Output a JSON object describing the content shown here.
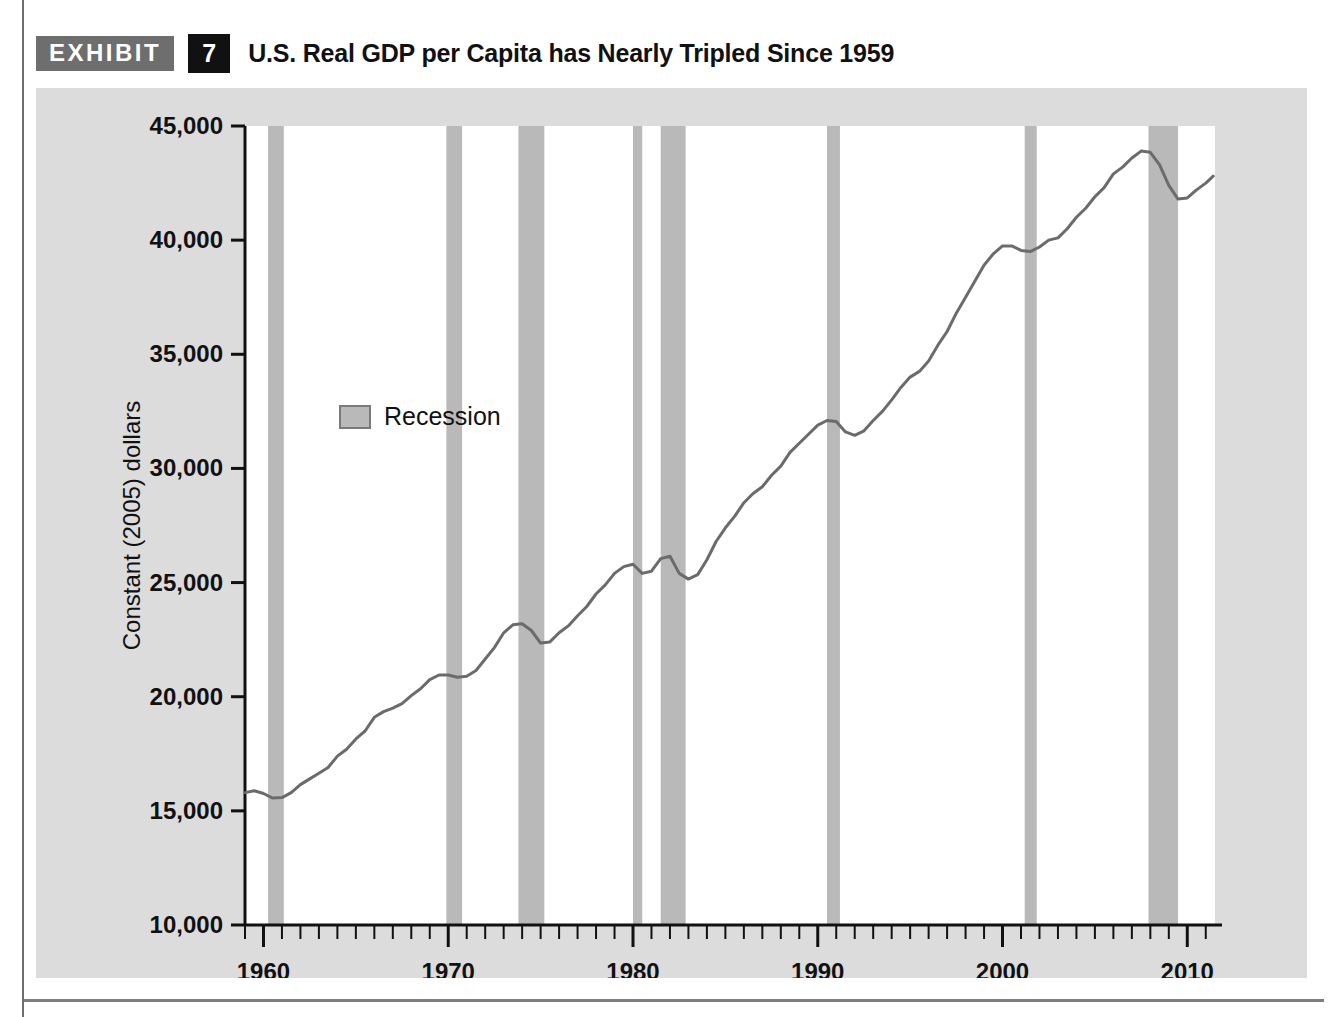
{
  "exhibit": {
    "badge_label": "EXHIBIT",
    "number": "7",
    "title": "U.S. Real GDP per Capita has Nearly Tripled Since 1959"
  },
  "colors": {
    "panel_background": "#dcdcdc",
    "plot_background": "#ffffff",
    "recession_band": "#b9b9b9",
    "line": "#6b6b6b",
    "axis": "#111111",
    "badge_gray": "#6e6e6e",
    "badge_black": "#111111"
  },
  "chart_data": {
    "type": "line",
    "title": "U.S. Real GDP per Capita has Nearly Tripled Since 1959",
    "xlabel": "",
    "ylabel": "Constant (2005) dollars",
    "xlim": [
      1959,
      2011.5
    ],
    "ylim": [
      10000,
      45000
    ],
    "ytick_values": [
      10000,
      15000,
      20000,
      25000,
      30000,
      35000,
      40000,
      45000
    ],
    "ytick_labels": [
      "10,000",
      "15,000",
      "20,000",
      "25,000",
      "30,000",
      "35,000",
      "40,000",
      "45,000"
    ],
    "xtick_values": [
      1960,
      1970,
      1980,
      1990,
      2000,
      2010
    ],
    "xtick_labels": [
      "1960",
      "1970",
      "1980",
      "1990",
      "2000",
      "2010"
    ],
    "minor_xtick_interval": 1,
    "grid": false,
    "legend_position": "inside-upper-left",
    "legend": [
      {
        "label": "Recession",
        "swatch_color": "#b9b9b9",
        "type": "band"
      }
    ],
    "series": [
      {
        "name": "Real GDP per capita",
        "units": "Constant (2005) dollars",
        "x": [
          1959.0,
          1959.5,
          1960.0,
          1960.5,
          1961.0,
          1961.5,
          1962.0,
          1962.5,
          1963.0,
          1963.5,
          1964.0,
          1964.5,
          1965.0,
          1965.5,
          1966.0,
          1966.5,
          1967.0,
          1967.5,
          1968.0,
          1968.5,
          1969.0,
          1969.5,
          1970.0,
          1970.5,
          1971.0,
          1971.5,
          1972.0,
          1972.5,
          1973.0,
          1973.5,
          1974.0,
          1974.5,
          1975.0,
          1975.5,
          1976.0,
          1976.5,
          1977.0,
          1977.5,
          1978.0,
          1978.5,
          1979.0,
          1979.5,
          1980.0,
          1980.5,
          1981.0,
          1981.5,
          1982.0,
          1982.5,
          1983.0,
          1983.5,
          1984.0,
          1984.5,
          1985.0,
          1985.5,
          1986.0,
          1986.5,
          1987.0,
          1987.5,
          1988.0,
          1988.5,
          1989.0,
          1989.5,
          1990.0,
          1990.5,
          1991.0,
          1991.5,
          1992.0,
          1992.5,
          1993.0,
          1993.5,
          1994.0,
          1994.5,
          1995.0,
          1995.5,
          1996.0,
          1996.5,
          1997.0,
          1997.5,
          1998.0,
          1998.5,
          1999.0,
          1999.5,
          2000.0,
          2000.5,
          2001.0,
          2001.5,
          2002.0,
          2002.5,
          2003.0,
          2003.5,
          2004.0,
          2004.5,
          2005.0,
          2005.5,
          2006.0,
          2006.5,
          2007.0,
          2007.5,
          2008.0,
          2008.5,
          2009.0,
          2009.5,
          2010.0,
          2010.5,
          2011.0,
          2011.4
        ],
        "y": [
          15800,
          15880,
          15760,
          15560,
          15580,
          15800,
          16150,
          16400,
          16650,
          16900,
          17400,
          17700,
          18150,
          18500,
          19100,
          19350,
          19500,
          19700,
          20050,
          20350,
          20750,
          20950,
          20950,
          20850,
          20900,
          21150,
          21650,
          22150,
          22800,
          23150,
          23200,
          22900,
          22350,
          22400,
          22800,
          23100,
          23550,
          23950,
          24500,
          24900,
          25400,
          25700,
          25800,
          25400,
          25500,
          26050,
          26150,
          25400,
          25150,
          25350,
          26000,
          26800,
          27400,
          27900,
          28500,
          28900,
          29200,
          29700,
          30100,
          30700,
          31100,
          31500,
          31900,
          32100,
          32050,
          31600,
          31450,
          31650,
          32100,
          32500,
          33000,
          33550,
          34000,
          34250,
          34700,
          35400,
          36000,
          36800,
          37500,
          38200,
          38900,
          39400,
          39750,
          39750,
          39550,
          39500,
          39700,
          40000,
          40100,
          40500,
          41000,
          41400,
          41900,
          42300,
          42900,
          43200,
          43600,
          43900,
          43850,
          43300,
          42400,
          41800,
          41850,
          42200,
          42500,
          42800
        ]
      }
    ],
    "recessions": [
      {
        "label": "1960-61 recession",
        "start": 1960.25,
        "end": 1961.1
      },
      {
        "label": "1969-70 recession",
        "start": 1969.9,
        "end": 1970.75
      },
      {
        "label": "1973-75 recession",
        "start": 1973.8,
        "end": 1975.2
      },
      {
        "label": "1980 recession",
        "start": 1980.0,
        "end": 1980.5
      },
      {
        "label": "1981-82 recession",
        "start": 1981.5,
        "end": 1982.85
      },
      {
        "label": "1990-91 recession",
        "start": 1990.5,
        "end": 1991.2
      },
      {
        "label": "2001 recession",
        "start": 2001.2,
        "end": 2001.85
      },
      {
        "label": "2007-09 recession",
        "start": 2007.9,
        "end": 2009.5
      }
    ]
  }
}
